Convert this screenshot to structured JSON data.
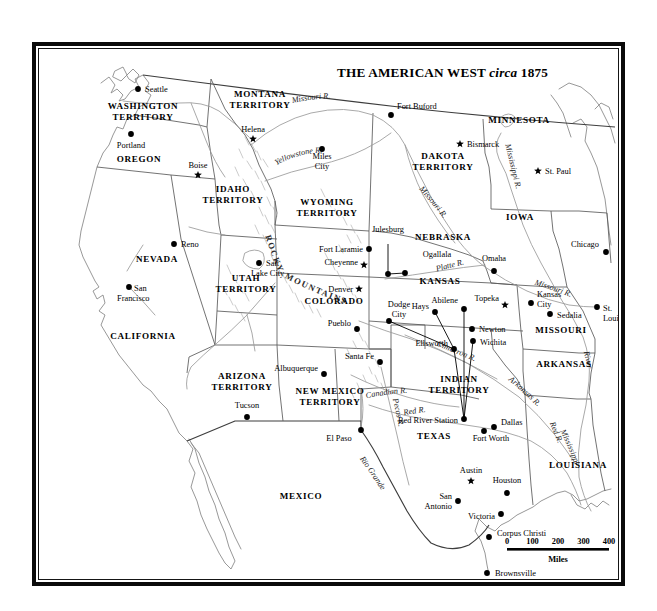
{
  "title": {
    "main": "THE AMERICAN WEST",
    "italic": "circa",
    "year": "1875"
  },
  "scale": {
    "ticks": [
      "0",
      "100",
      "200",
      "300",
      "400"
    ],
    "unit": "Miles"
  },
  "regions": [
    {
      "name": "WASHINGTON TERRITORY",
      "lines": [
        "WASHINGTON",
        "TERRITORY"
      ],
      "x": 104,
      "y": 60
    },
    {
      "name": "OREGON",
      "lines": [
        "OREGON"
      ],
      "x": 100,
      "y": 113
    },
    {
      "name": "MONTANA TERRITORY",
      "lines": [
        "MONTANA",
        "TERRITORY"
      ],
      "x": 221,
      "y": 48
    },
    {
      "name": "IDAHO TERRITORY",
      "lines": [
        "IDAHO",
        "TERRITORY"
      ],
      "x": 194,
      "y": 143
    },
    {
      "name": "WYOMING TERRITORY",
      "lines": [
        "WYOMING",
        "TERRITORY"
      ],
      "x": 288,
      "y": 156
    },
    {
      "name": "DAKOTA TERRITORY",
      "lines": [
        "DAKOTA",
        "TERRITORY"
      ],
      "x": 404,
      "y": 110
    },
    {
      "name": "MINNESOTA",
      "lines": [
        "MINNESOTA"
      ],
      "x": 480,
      "y": 74
    },
    {
      "name": "NEVADA",
      "lines": [
        "NEVADA"
      ],
      "x": 118,
      "y": 213
    },
    {
      "name": "UTAH TERRITORY",
      "lines": [
        "UTAH",
        "TERRITORY"
      ],
      "x": 207,
      "y": 232
    },
    {
      "name": "COLORADO",
      "lines": [
        "COLORADO"
      ],
      "x": 295,
      "y": 255
    },
    {
      "name": "NEBRASKA",
      "lines": [
        "NEBRASKA"
      ],
      "x": 404,
      "y": 191
    },
    {
      "name": "IOWA",
      "lines": [
        "IOWA"
      ],
      "x": 481,
      "y": 171
    },
    {
      "name": "KANSAS",
      "lines": [
        "KANSAS"
      ],
      "x": 401,
      "y": 235
    },
    {
      "name": "MISSOURI",
      "lines": [
        "MISSOURI"
      ],
      "x": 522,
      "y": 284
    },
    {
      "name": "ARKANSAS",
      "lines": [
        "ARKANSAS"
      ],
      "x": 525,
      "y": 318
    },
    {
      "name": "CALIFORNIA",
      "lines": [
        "CALIFORNIA"
      ],
      "x": 104,
      "y": 290
    },
    {
      "name": "ARIZONA TERRITORY",
      "lines": [
        "ARIZONA",
        "TERRITORY"
      ],
      "x": 203,
      "y": 330
    },
    {
      "name": "NEW MEXICO TERRITORY",
      "lines": [
        "NEW MEXICO",
        "TERRITORY"
      ],
      "x": 291,
      "y": 345
    },
    {
      "name": "INDIAN TERRITORY",
      "lines": [
        "INDIAN",
        "TERRITORY"
      ],
      "x": 420,
      "y": 333
    },
    {
      "name": "TEXAS",
      "lines": [
        "TEXAS"
      ],
      "x": 395,
      "y": 390
    },
    {
      "name": "LOUISIANA",
      "lines": [
        "LOUISIANA"
      ],
      "x": 539,
      "y": 419
    },
    {
      "name": "MEXICO",
      "lines": [
        "MEXICO"
      ],
      "x": 262,
      "y": 450
    }
  ],
  "cities": [
    {
      "name": "Seattle",
      "dx": 99,
      "dy": 40,
      "lx": 106,
      "ly": 43,
      "anchor": "start",
      "capital": false
    },
    {
      "name": "Portland",
      "dx": 92,
      "dy": 85,
      "lx": 92,
      "ly": 99,
      "anchor": "middle",
      "capital": false
    },
    {
      "name": "Helena",
      "dx": 214,
      "dy": 90,
      "lx": 214,
      "ly": 83,
      "anchor": "middle",
      "capital": true
    },
    {
      "name": "Boise",
      "dx": 159,
      "dy": 126,
      "lx": 159,
      "ly": 119,
      "anchor": "middle",
      "capital": true
    },
    {
      "name": "Miles City",
      "dx": 283,
      "dy": 100,
      "lx": 283,
      "ly": 110,
      "anchor": "middle",
      "capital": false,
      "lines": [
        "Miles",
        "City"
      ]
    },
    {
      "name": "Fort Buford",
      "dx": 352,
      "dy": 66,
      "lx": 358,
      "ly": 60,
      "anchor": "start",
      "capital": false
    },
    {
      "name": "Bismarck",
      "dx": 421,
      "dy": 95,
      "lx": 428,
      "ly": 98,
      "anchor": "start",
      "capital": true
    },
    {
      "name": "St. Paul",
      "dx": 499,
      "dy": 122,
      "lx": 506,
      "ly": 125,
      "anchor": "start",
      "capital": true
    },
    {
      "name": "Reno",
      "dx": 135,
      "dy": 195,
      "lx": 142,
      "ly": 198,
      "anchor": "start",
      "capital": false
    },
    {
      "name": "San Francisco",
      "dx": 90,
      "dy": 238,
      "lx": 95,
      "ly": 242,
      "anchor": "start",
      "capital": false,
      "lines": [
        "San",
        "Francisco"
      ],
      "lx2": 78
    },
    {
      "name": "Salt Lake City",
      "dx": 220,
      "dy": 214,
      "lx": 227,
      "ly": 217,
      "anchor": "start",
      "capital": false,
      "lines": [
        "Salt",
        "Lake City"
      ],
      "lx2": 212
    },
    {
      "name": "Fort Laramie",
      "dx": 330,
      "dy": 200,
      "lx": 324,
      "ly": 203,
      "anchor": "end",
      "capital": false
    },
    {
      "name": "Cheyenne",
      "dx": 325,
      "dy": 216,
      "lx": 319,
      "ly": 216,
      "anchor": "end",
      "capital": true
    },
    {
      "name": "Denver",
      "dx": 320,
      "dy": 240,
      "lx": 314,
      "ly": 243,
      "anchor": "end",
      "capital": true
    },
    {
      "name": "Julesburg",
      "dx": 349,
      "dy": 225,
      "lx": 349,
      "ly": 183,
      "anchor": "middle",
      "capital": false
    },
    {
      "name": "Ogallala",
      "dx": 366,
      "dy": 224,
      "lx": 398,
      "ly": 208,
      "anchor": "middle",
      "capital": false
    },
    {
      "name": "Omaha",
      "dx": 455,
      "dy": 222,
      "lx": 455,
      "ly": 212,
      "anchor": "middle",
      "capital": false
    },
    {
      "name": "Chicago",
      "dx": 567,
      "dy": 203,
      "lx": 560,
      "ly": 198,
      "anchor": "end",
      "capital": false
    },
    {
      "name": "Pueblo",
      "dx": 318,
      "dy": 280,
      "lx": 312,
      "ly": 277,
      "anchor": "end",
      "capital": false
    },
    {
      "name": "Dodge City",
      "dx": 350,
      "dy": 272,
      "lx": 360,
      "ly": 258,
      "anchor": "middle",
      "capital": false,
      "lines": [
        "Dodge",
        "City"
      ]
    },
    {
      "name": "Hays",
      "dx": 396,
      "dy": 263,
      "lx": 390,
      "ly": 260,
      "anchor": "end",
      "capital": false
    },
    {
      "name": "Abilene",
      "dx": 425,
      "dy": 260,
      "lx": 419,
      "ly": 254,
      "anchor": "end",
      "capital": false
    },
    {
      "name": "Topeka",
      "dx": 466,
      "dy": 256,
      "lx": 460,
      "ly": 252,
      "anchor": "end",
      "capital": true
    },
    {
      "name": "Kansas City",
      "dx": 492,
      "dy": 254,
      "lx": 498,
      "ly": 248,
      "anchor": "start",
      "capital": false,
      "lines": [
        "Kansas",
        "City"
      ]
    },
    {
      "name": "Sedalia",
      "dx": 511,
      "dy": 265,
      "lx": 518,
      "ly": 269,
      "anchor": "start",
      "capital": false
    },
    {
      "name": "St. Louis",
      "dx": 558,
      "dy": 258,
      "lx": 564,
      "ly": 262,
      "anchor": "start",
      "capital": false,
      "lines": [
        "St.",
        "Louis"
      ]
    },
    {
      "name": "Newton",
      "dx": 433,
      "dy": 280,
      "lx": 440,
      "ly": 283,
      "anchor": "start",
      "capital": false
    },
    {
      "name": "Wichita",
      "dx": 434,
      "dy": 292,
      "lx": 441,
      "ly": 296,
      "anchor": "start",
      "capital": false
    },
    {
      "name": "Ellsworth",
      "dx": 415,
      "dy": 300,
      "lx": 409,
      "ly": 297,
      "anchor": "end",
      "capital": false
    },
    {
      "name": "Santa Fe",
      "dx": 341,
      "dy": 313,
      "lx": 335,
      "ly": 310,
      "anchor": "end",
      "capital": false
    },
    {
      "name": "Albuquerque",
      "dx": 285,
      "dy": 325,
      "lx": 279,
      "ly": 322,
      "anchor": "end",
      "capital": false
    },
    {
      "name": "Tucson",
      "dx": 208,
      "dy": 368,
      "lx": 208,
      "ly": 359,
      "anchor": "middle",
      "capital": false
    },
    {
      "name": "El Paso",
      "dx": 322,
      "dy": 381,
      "lx": 300,
      "ly": 392,
      "anchor": "middle",
      "capital": false
    },
    {
      "name": "Red River Station",
      "dx": 425,
      "dy": 370,
      "lx": 419,
      "ly": 374,
      "anchor": "end",
      "capital": false
    },
    {
      "name": "Dallas",
      "dx": 455,
      "dy": 378,
      "lx": 462,
      "ly": 376,
      "anchor": "start",
      "capital": false
    },
    {
      "name": "Fort Worth",
      "dx": 445,
      "dy": 382,
      "lx": 452,
      "ly": 392,
      "anchor": "middle",
      "capital": false
    },
    {
      "name": "Austin",
      "dx": 432,
      "dy": 432,
      "lx": 432,
      "ly": 424,
      "anchor": "middle",
      "capital": true
    },
    {
      "name": "Houston",
      "dx": 468,
      "dy": 444,
      "lx": 468,
      "ly": 434,
      "anchor": "middle",
      "capital": false
    },
    {
      "name": "San Antonio",
      "dx": 419,
      "dy": 452,
      "lx": 413,
      "ly": 450,
      "anchor": "end",
      "capital": false,
      "lines": [
        "San",
        "Antonio"
      ]
    },
    {
      "name": "Victoria",
      "dx": 462,
      "dy": 465,
      "lx": 456,
      "ly": 470,
      "anchor": "end",
      "capital": false
    },
    {
      "name": "Corpus Christi",
      "dx": 450,
      "dy": 488,
      "lx": 458,
      "ly": 487,
      "anchor": "start",
      "capital": false
    },
    {
      "name": "Brownsville",
      "dx": 448,
      "dy": 524,
      "lx": 456,
      "ly": 527,
      "anchor": "start",
      "capital": false
    }
  ],
  "rivers": [
    {
      "name": "Missouri R.",
      "label": "Missouri R."
    },
    {
      "name": "Yellowstone R.",
      "label": "Yellowstone R."
    },
    {
      "name": "Missouri R. 2",
      "label": "Missouri R."
    },
    {
      "name": "Mississippi R.",
      "label": "Mississippi R."
    },
    {
      "name": "Platte R.",
      "label": "Platte R."
    },
    {
      "name": "Missouri R. 3",
      "label": "Missouri R."
    },
    {
      "name": "Cimarron R.",
      "label": "Cimarron R."
    },
    {
      "name": "Arkansas R.",
      "label": "Arkansas R."
    },
    {
      "name": "Canadian R.",
      "label": "Canadian R."
    },
    {
      "name": "Red R.",
      "label": "Red R."
    },
    {
      "name": "Red R. 2",
      "label": "Red R."
    },
    {
      "name": "Pecos R.",
      "label": "Pecos R."
    },
    {
      "name": "Rio Grande",
      "label": "Rio Grande"
    },
    {
      "name": "Mississippi River",
      "label": "River"
    },
    {
      "name": "Mississippi R. 2",
      "label": "Mississippi"
    }
  ],
  "ranges": [
    {
      "name": "ROCKY",
      "label": "ROCKY"
    },
    {
      "name": "MOUNTAINS",
      "label": "MOUNTAINS"
    }
  ]
}
